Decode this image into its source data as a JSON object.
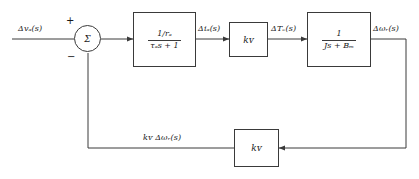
{
  "diagram": {
    "line_color": "#3a3a3a",
    "background": "#ffffff",
    "input": {
      "label": "Δvₐ(s)",
      "label_plain": "Delta v_a(s)"
    },
    "summer": {
      "symbol": "Σ",
      "plus_sign": "+",
      "minus_sign": "−"
    },
    "blocks": [
      {
        "id": "armature-block",
        "name": "armature-transfer-function-block",
        "numerator": "1/rₐ",
        "denominator": "τₐs + 1",
        "kind": "fraction"
      },
      {
        "id": "torque-constant-block",
        "name": "torque-constant-block",
        "gain": "kᴠ",
        "kind": "gain"
      },
      {
        "id": "mechanical-block",
        "name": "mechanical-transfer-function-block",
        "numerator": "1",
        "denominator": "Js + Bₘ",
        "kind": "fraction"
      },
      {
        "id": "feedback-gain-block",
        "name": "feedback-gain-block",
        "gain": "kᴠ",
        "kind": "gain"
      }
    ],
    "signals": [
      {
        "id": "input-signal",
        "label": "Δvₐ(s)"
      },
      {
        "id": "current-signal",
        "label": "Δiₐ(s)"
      },
      {
        "id": "torque-signal",
        "label": "ΔTₑ(s)"
      },
      {
        "id": "speed-signal",
        "label": "Δωᵣ(s)"
      },
      {
        "id": "feedback-signal",
        "label": "kᴠ Δωᵣ(s)"
      }
    ]
  }
}
